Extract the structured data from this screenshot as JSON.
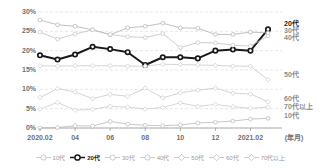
{
  "chart_data": {
    "type": "line",
    "title": "",
    "xlabel": "(年月)",
    "ylabel": "",
    "ylim": [
      0,
      30
    ],
    "yticks": [
      "0%",
      "5%",
      "10%",
      "15%",
      "20%",
      "25%",
      "30%"
    ],
    "grid": true,
    "legend_position": "bottom",
    "x": [
      "2020.02",
      "2020.03",
      "2020.04",
      "2020.05",
      "2020.06",
      "2020.07",
      "2020.08",
      "2020.09",
      "2020.10",
      "2020.11",
      "2020.12",
      "2021.01",
      "2021.02",
      "2021.03"
    ],
    "xtick_labels": [
      "2020.02",
      "04",
      "06",
      "08",
      "10",
      "12",
      "2021.02"
    ],
    "xtick_indices": [
      0,
      2,
      4,
      6,
      8,
      10,
      12
    ],
    "series": [
      {
        "name": "10代",
        "color": "#b9b9b9",
        "marker": "circle",
        "highlight": false,
        "end_label": "10代",
        "values": [
          0.0,
          0.1,
          0.6,
          0.5,
          1.7,
          1.0,
          0.7,
          0.6,
          0.8,
          1.3,
          1.5,
          1.8,
          2.3,
          2.5
        ]
      },
      {
        "name": "20代",
        "color": "#1a1a1a",
        "marker": "circle",
        "highlight": true,
        "end_label": "20代",
        "values": [
          18.8,
          17.7,
          19.0,
          21.0,
          20.4,
          19.6,
          16.3,
          18.3,
          18.3,
          18.0,
          20.0,
          20.3,
          20.0,
          25.5
        ]
      },
      {
        "name": "30代",
        "color": "#b0b0b0",
        "marker": "circle",
        "highlight": false,
        "end_label": "30代",
        "values": [
          27.9,
          26.7,
          26.3,
          25.4,
          24.1,
          25.9,
          26.3,
          27.1,
          25.9,
          25.8,
          24.2,
          24.2,
          24.8,
          24.6
        ]
      },
      {
        "name": "40代",
        "color": "#c2c2c2",
        "marker": "circle",
        "highlight": false,
        "end_label": "40代",
        "values": [
          24.8,
          23.0,
          24.3,
          25.4,
          24.2,
          23.6,
          23.4,
          24.4,
          20.8,
          22.1,
          22.0,
          21.4,
          21.2,
          23.8
        ]
      },
      {
        "name": "50代",
        "color": "#c9c9c9",
        "marker": "diamond",
        "highlight": false,
        "end_label": "50代",
        "values": [
          16.1,
          16.0,
          16.1,
          16.1,
          16.1,
          16.0,
          16.0,
          16.5,
          16.4,
          16.3,
          16.2,
          16.0,
          16.0,
          12.5
        ]
      },
      {
        "name": "60代",
        "color": "#c9c9c9",
        "marker": "diamond",
        "highlight": false,
        "end_label": "60代",
        "values": [
          7.9,
          10.2,
          9.3,
          7.6,
          8.7,
          8.2,
          10.3,
          7.8,
          9.1,
          9.8,
          10.3,
          9.0,
          8.8,
          6.8
        ]
      },
      {
        "name": "70代以上",
        "color": "#cccccc",
        "marker": "diamond",
        "highlight": false,
        "end_label": "70代以上",
        "values": [
          4.9,
          6.6,
          4.6,
          4.8,
          5.6,
          5.4,
          4.9,
          5.3,
          6.5,
          5.6,
          6.1,
          5.5,
          5.1,
          5.4
        ]
      }
    ]
  },
  "legend": {
    "items": [
      {
        "label": "10代",
        "marker": "circle",
        "highlight": false
      },
      {
        "label": "20代",
        "marker": "circle",
        "highlight": true
      },
      {
        "label": "30代",
        "marker": "circle",
        "highlight": false
      },
      {
        "label": "40代",
        "marker": "circle",
        "highlight": false
      },
      {
        "label": "50代",
        "marker": "diamond",
        "highlight": false
      },
      {
        "label": "60代",
        "marker": "diamond",
        "highlight": false
      },
      {
        "label": "70代以上",
        "marker": "diamond",
        "highlight": false
      }
    ]
  }
}
